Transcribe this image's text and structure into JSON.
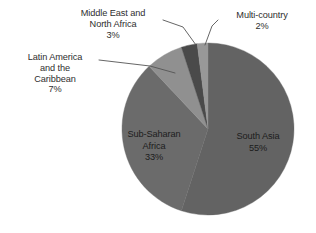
{
  "chart_data": {
    "type": "pie",
    "title": "",
    "labels": [
      "South Asia",
      "Sub-Saharan Africa",
      "Latin America and the Caribbean",
      "Middle East and North Africa",
      "Multi-country"
    ],
    "values": [
      55,
      33,
      7,
      3,
      2
    ],
    "value_unit": "%",
    "colors": [
      "#636363",
      "#6b6b6b",
      "#909090",
      "#4a4a4a",
      "#989898"
    ],
    "start_angle_deg": 0,
    "direction": "clockwise",
    "legend": "none",
    "grid": false,
    "labels_position": "inside-and-callout"
  },
  "chart": {
    "background_color": "#ffffff",
    "text_color": "#2e2e2e",
    "leader_line_color": "#555555",
    "slices": [
      {
        "key": "south-asia",
        "name": "South Asia",
        "percent_text": "55%",
        "value": 55,
        "color": "#636363",
        "label_placement": "inside",
        "name_lines": [
          "South Asia"
        ]
      },
      {
        "key": "sub-saharan-africa",
        "name": "Sub-Saharan Africa",
        "percent_text": "33%",
        "value": 33,
        "color": "#6b6b6b",
        "label_placement": "inside",
        "name_lines": [
          "Sub-Saharan",
          "Africa"
        ]
      },
      {
        "key": "latin-america-caribbean",
        "name": "Latin America and the Caribbean",
        "percent_text": "7%",
        "value": 7,
        "color": "#909090",
        "label_placement": "callout",
        "name_lines": [
          "Latin America",
          "and the",
          "Caribbean"
        ]
      },
      {
        "key": "middle-east-north-africa",
        "name": "Middle East and North Africa",
        "percent_text": "3%",
        "value": 3,
        "color": "#4a4a4a",
        "label_placement": "callout",
        "name_lines": [
          "Middle East and",
          "North Africa"
        ]
      },
      {
        "key": "multi-country",
        "name": "Multi-country",
        "percent_text": "2%",
        "value": 2,
        "color": "#989898",
        "label_placement": "callout",
        "name_lines": [
          "Multi-country"
        ]
      }
    ]
  }
}
